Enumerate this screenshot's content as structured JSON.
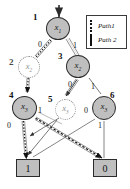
{
  "figure": {
    "kind": "binary-decision-diagram",
    "background": "#ffffff",
    "node_fill": "#bfbfbf",
    "node_stroke": "#2b2b2b",
    "ghost_stroke": "#8a8a8a",
    "edge_color": "#4a4a4a",
    "path_color": "#111111"
  },
  "legend": {
    "items": [
      {
        "label": "Path1",
        "style": "dotted",
        "swatch": "dotted-line-swatch"
      },
      {
        "label": "Path 2",
        "style": "dashed",
        "swatch": "dashed-line-swatch"
      }
    ]
  },
  "root_arrow": {
    "name": "root-entry-arrow"
  },
  "nodes": [
    {
      "id": "1",
      "index": "1",
      "var": "x",
      "sub": "1",
      "style": "solid"
    },
    {
      "id": "2",
      "index": "2",
      "var": "x",
      "sub": "2",
      "style": "ghost"
    },
    {
      "id": "3",
      "index": "3",
      "var": "x",
      "sub": "2",
      "style": "solid"
    },
    {
      "id": "4",
      "index": "4",
      "var": "x",
      "sub": "3",
      "style": "solid"
    },
    {
      "id": "5",
      "index": "5",
      "var": "x",
      "sub": "3",
      "style": "ghost"
    },
    {
      "id": "6",
      "index": "6",
      "var": "x",
      "sub": "3",
      "style": "solid"
    }
  ],
  "terminals": [
    {
      "id": "t1",
      "label": "1"
    },
    {
      "id": "t0",
      "label": "0"
    }
  ],
  "edge_labels": [
    {
      "from": "1",
      "value": "0"
    },
    {
      "from": "1",
      "value": "1"
    },
    {
      "from": "3",
      "value": "0"
    },
    {
      "from": "3",
      "value": "1"
    },
    {
      "from": "4",
      "value": "0"
    },
    {
      "from": "4",
      "value": "1"
    },
    {
      "from": "6",
      "value": "0"
    },
    {
      "from": "6",
      "value": "1"
    }
  ]
}
